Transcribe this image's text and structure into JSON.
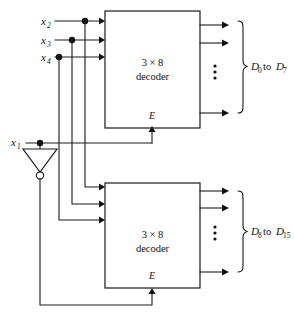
{
  "figure": {
    "background_color": "#ffffff",
    "line_color": "#1a1a1a"
  },
  "inputs": [
    {
      "id": "x2",
      "base": "x",
      "sub": "2"
    },
    {
      "id": "x3",
      "base": "x",
      "sub": "3"
    },
    {
      "id": "x4",
      "base": "x",
      "sub": "4"
    },
    {
      "id": "x1",
      "base": "x",
      "sub": "1"
    }
  ],
  "decoders": [
    {
      "id": "top-decoder",
      "line1": "3  ×  8",
      "line2": "decoder",
      "enable_label": "E"
    },
    {
      "id": "bottom-decoder",
      "line1": "3  ×  8",
      "line2": "decoder",
      "enable_label": "E"
    }
  ],
  "outputs": [
    {
      "id": "top-outputs",
      "first_base": "D",
      "first_sub": "0",
      "connector": "to",
      "last_base": "D",
      "last_sub": "7",
      "ellipsis": "⋮"
    },
    {
      "id": "bottom-outputs",
      "first_base": "D",
      "first_sub": "8",
      "connector": "to",
      "last_base": "D",
      "last_sub": "15",
      "ellipsis": "⋮"
    }
  ],
  "gates": [
    {
      "id": "inverter",
      "type": "not-gate",
      "label": ""
    }
  ]
}
